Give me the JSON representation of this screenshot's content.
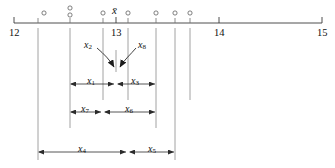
{
  "figure": {
    "type": "number-line-diagram",
    "axis": {
      "min": 12,
      "max": 15,
      "tick_labels": [
        "12",
        "13",
        "14",
        "15"
      ],
      "tick_values": [
        12,
        13,
        14,
        15
      ],
      "minor_tick_values": [
        12.38,
        12.78,
        13.06,
        13.32,
        13.58,
        13.74,
        13.9
      ]
    },
    "mean_symbol": "x̄",
    "data_points": [
      {
        "value": 12.45,
        "row": 0
      },
      {
        "value": 12.72,
        "row": 0
      },
      {
        "value": 12.72,
        "row": 1
      },
      {
        "value": 13.04,
        "row": 0
      },
      {
        "value": 13.28,
        "row": 0
      },
      {
        "value": 13.58,
        "row": 0
      },
      {
        "value": 13.74,
        "row": 0
      },
      {
        "value": 13.9,
        "row": 0
      }
    ],
    "callouts": [
      {
        "label": "x",
        "subscript": "2"
      },
      {
        "label": "x",
        "subscript": "8"
      }
    ],
    "measures": [
      {
        "label": "x",
        "subscript": "1"
      },
      {
        "label": "x",
        "subscript": "3"
      },
      {
        "label": "x",
        "subscript": "7"
      },
      {
        "label": "x",
        "subscript": "6"
      },
      {
        "label": "x",
        "subscript": "4"
      },
      {
        "label": "x",
        "subscript": "5"
      }
    ],
    "colors": {
      "line": "#3a3a3a",
      "guide": "#8c8c8c",
      "text": "#111111",
      "marker": "#555555",
      "background": "#ffffff"
    },
    "corner_mark": ""
  }
}
